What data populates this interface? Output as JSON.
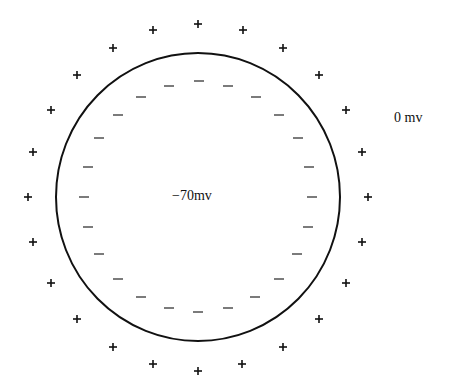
{
  "diagram": {
    "membrane": {
      "cx": 198,
      "cy": 197,
      "rx": 142,
      "ry": 144,
      "stroke": "#111111"
    },
    "inside_label": "−70mv",
    "outside_label": "0 mv",
    "outside_charge": "+",
    "inside_charge": "−",
    "plus_positions": [
      [
        198,
        24
      ],
      [
        153,
        30
      ],
      [
        243,
        30
      ],
      [
        113,
        48
      ],
      [
        283,
        48
      ],
      [
        77,
        75
      ],
      [
        319,
        75
      ],
      [
        51,
        110
      ],
      [
        346,
        110
      ],
      [
        33,
        152
      ],
      [
        362,
        152
      ],
      [
        28,
        197
      ],
      [
        368,
        197
      ],
      [
        33,
        242
      ],
      [
        362,
        242
      ],
      [
        51,
        283
      ],
      [
        346,
        283
      ],
      [
        77,
        319
      ],
      [
        319,
        319
      ],
      [
        113,
        347
      ],
      [
        283,
        347
      ],
      [
        153,
        364
      ],
      [
        242,
        364
      ],
      [
        198,
        371
      ]
    ],
    "minus_positions": [
      [
        199,
        81
      ],
      [
        169,
        86
      ],
      [
        228,
        86
      ],
      [
        141,
        97
      ],
      [
        256,
        97
      ],
      [
        118,
        115
      ],
      [
        279,
        115
      ],
      [
        99,
        138
      ],
      [
        298,
        138
      ],
      [
        88,
        167
      ],
      [
        309,
        167
      ],
      [
        84,
        197
      ],
      [
        312,
        197
      ],
      [
        88,
        227
      ],
      [
        308,
        227
      ],
      [
        99,
        254
      ],
      [
        297,
        254
      ],
      [
        118,
        279
      ],
      [
        279,
        279
      ],
      [
        141,
        297
      ],
      [
        255,
        297
      ],
      [
        169,
        308
      ],
      [
        198,
        312
      ],
      [
        228,
        308
      ]
    ]
  }
}
